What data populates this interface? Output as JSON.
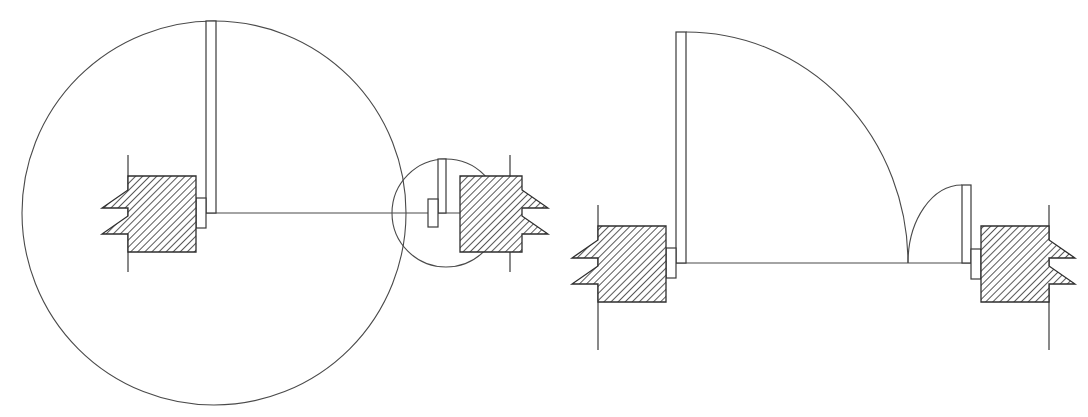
{
  "figure": {
    "background_color": "#ffffff",
    "line_color": "#3a3a3a",
    "hatch_color": "#2e2e2e",
    "canvas": {
      "width": 1088,
      "height": 417
    }
  },
  "views": [
    {
      "id": "front-view",
      "name": "Front view (left)",
      "center_line_y": 213,
      "large_circle": {
        "cx": 214,
        "cy": 213,
        "r": 192
      },
      "small_circle": {
        "cx": 446,
        "cy": 213,
        "r": 54
      },
      "tangent_point": {
        "x": 392,
        "y": 213
      },
      "large_blade": {
        "x": 206,
        "y_top": 21,
        "y_bottom": 213,
        "thickness": 10
      },
      "small_blade": {
        "x": 438,
        "y_top": 159,
        "y_bottom": 213,
        "thickness": 8
      },
      "hub_large": {
        "x": 196,
        "y": 198,
        "w": 10,
        "h": 30
      },
      "hub_small": {
        "x": 428,
        "y": 199,
        "w": 10,
        "h": 28
      },
      "support_left": {
        "x": 128,
        "y": 176,
        "w": 68,
        "h": 76,
        "notch_depth": 26,
        "notch_height": 18
      },
      "support_right": {
        "x": 460,
        "y": 176,
        "w": 62,
        "h": 76,
        "notch_depth": 26,
        "notch_height": 18
      },
      "ref_line_left": {
        "x": 128,
        "y_top": 155,
        "y_bottom": 272
      },
      "ref_line_right": {
        "x": 510,
        "y_top": 155,
        "y_bottom": 272
      }
    },
    {
      "id": "side-view",
      "name": "Side view (right)",
      "base_line_y": 263,
      "base_line_x_start": 680,
      "base_line_x_end": 980,
      "large_blade": {
        "x": 676,
        "y_top": 32,
        "y_bottom": 263,
        "thickness": 10
      },
      "large_sweep_arc": {
        "start": {
          "x": 686,
          "y": 32
        },
        "end": {
          "x": 908,
          "y": 263
        },
        "rx": 222,
        "ry": 231
      },
      "small_blade": {
        "x": 962,
        "y_top": 185,
        "y_bottom": 263,
        "thickness": 9
      },
      "small_sweep_arc": {
        "start": {
          "x": 962,
          "y": 185
        },
        "end": {
          "x": 908,
          "y": 263
        },
        "rx": 54,
        "ry": 78
      },
      "hub_left": {
        "x": 666,
        "y": 248,
        "w": 10,
        "h": 30
      },
      "hub_right": {
        "x": 971,
        "y": 249,
        "w": 10,
        "h": 30
      },
      "support_left": {
        "x": 598,
        "y": 226,
        "w": 68,
        "h": 76,
        "notch_depth": 26,
        "notch_height": 18
      },
      "support_right": {
        "x": 981,
        "y": 226,
        "w": 68,
        "h": 76,
        "notch_depth": 26,
        "notch_height": 18
      },
      "ref_line_left": {
        "x": 598,
        "y_top": 205,
        "y_bottom": 350
      },
      "ref_line_right": {
        "x": 1049,
        "y_top": 205,
        "y_bottom": 350
      }
    }
  ],
  "hatching": {
    "pattern": "diagonal-45",
    "spacing_px": 5,
    "stroke_width": 1,
    "color": "#2e2e2e"
  }
}
